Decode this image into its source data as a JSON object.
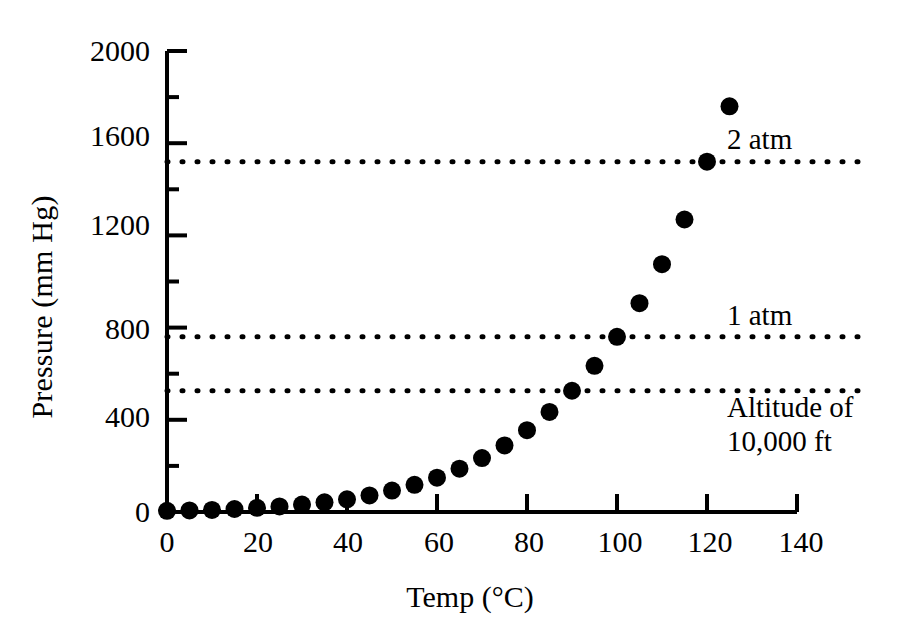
{
  "chart_data": {
    "type": "scatter",
    "title": "",
    "xlabel": "Temp (°C)",
    "ylabel": "Pressure (mm Hg)",
    "xlim": [
      0,
      140
    ],
    "ylim": [
      0,
      2000
    ],
    "xticks": [
      0,
      20,
      40,
      60,
      80,
      100,
      120,
      140
    ],
    "xtick_labels": [
      "0",
      "20",
      "40",
      "60",
      "80",
      "100",
      "120",
      "140"
    ],
    "x_minor_tick_interval": 10,
    "yticks": [
      0,
      400,
      800,
      1200,
      1600,
      2000
    ],
    "ytick_labels": [
      "0",
      "400",
      "800",
      "1200",
      "1600",
      "2000"
    ],
    "y_minor_tick_interval": 200,
    "grid": false,
    "legend": null,
    "marker": "filled-circle",
    "marker_color": "#000000",
    "x": [
      0,
      5,
      10,
      15,
      20,
      25,
      30,
      35,
      40,
      45,
      50,
      55,
      60,
      65,
      70,
      75,
      80,
      85,
      90,
      95,
      100,
      105,
      110,
      115,
      120,
      125
    ],
    "y": [
      5,
      7,
      9,
      13,
      18,
      24,
      32,
      42,
      55,
      72,
      93,
      118,
      149,
      188,
      234,
      289,
      355,
      434,
      526,
      634,
      760,
      906,
      1075,
      1269,
      1520,
      1760
    ],
    "series": [
      {
        "name": "Vapor pressure of water",
        "x": [
          0,
          5,
          10,
          15,
          20,
          25,
          30,
          35,
          40,
          45,
          50,
          55,
          60,
          65,
          70,
          75,
          80,
          85,
          90,
          95,
          100,
          105,
          110,
          115,
          120,
          125
        ],
        "values": [
          5,
          7,
          9,
          13,
          18,
          24,
          32,
          42,
          55,
          72,
          93,
          118,
          149,
          188,
          234,
          289,
          355,
          434,
          526,
          634,
          760,
          906,
          1075,
          1269,
          1520,
          1760
        ]
      }
    ],
    "reference_lines": [
      {
        "id": "two-atm",
        "label": "2 atm",
        "value": 1520,
        "style": "dotted",
        "label_position": "above-right"
      },
      {
        "id": "one-atm",
        "label": "1 atm",
        "value": 760,
        "style": "dotted",
        "label_position": "above-right"
      },
      {
        "id": "altitude",
        "label_line1": "Altitude of",
        "label_line2": "10,000 ft",
        "value": 526,
        "style": "dotted",
        "label_position": "below-right"
      }
    ]
  },
  "axes": {
    "y_title": "Pressure (mm Hg)",
    "x_title": "Temp (°C)"
  },
  "annotations": {
    "two_atm": "2 atm",
    "one_atm": "1 atm",
    "altitude_line1": "Altitude of",
    "altitude_line2": "10,000 ft"
  },
  "colors": {
    "ink": "#000000",
    "background": "#ffffff"
  }
}
